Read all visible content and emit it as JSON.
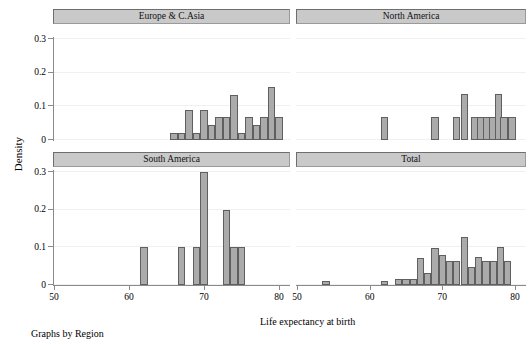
{
  "figure": {
    "ylabel": "Density",
    "xlabel": "Life expectancy at birth",
    "footnote": "Graphs by Region"
  },
  "axes": {
    "xticks": [
      "50",
      "60",
      "70",
      "80"
    ],
    "yticks": [
      "0.3",
      "0.2",
      "0.1",
      "0"
    ]
  },
  "panels": [
    {
      "title": "Europe & C.Asia"
    },
    {
      "title": "North America"
    },
    {
      "title": "South America"
    },
    {
      "title": "Total"
    }
  ],
  "chart_data": {
    "type": "bar",
    "title": "",
    "subtitle": "",
    "xlabel": "Life expectancy at birth",
    "ylabel": "Density",
    "xlim": [
      50,
      80
    ],
    "ylim": [
      0,
      0.3
    ],
    "xticks": [
      50,
      60,
      70,
      80
    ],
    "yticks": [
      0,
      0.1,
      0.2,
      0.3
    ],
    "grid": true,
    "legend": "none",
    "layout": "2x2 faceted histograms (Graphs by Region)",
    "binwidth": 1,
    "panels": [
      {
        "name": "Europe & C.Asia",
        "bins": [
          {
            "x": 66,
            "density": 0.021
          },
          {
            "x": 67,
            "density": 0.021
          },
          {
            "x": 68,
            "density": 0.089
          },
          {
            "x": 69,
            "density": 0.021
          },
          {
            "x": 70,
            "density": 0.089
          },
          {
            "x": 71,
            "density": 0.045
          },
          {
            "x": 72,
            "density": 0.067
          },
          {
            "x": 73,
            "density": 0.067
          },
          {
            "x": 74,
            "density": 0.134
          },
          {
            "x": 75,
            "density": 0.021
          },
          {
            "x": 76,
            "density": 0.067
          },
          {
            "x": 77,
            "density": 0.045
          },
          {
            "x": 78,
            "density": 0.067
          },
          {
            "x": 79,
            "density": 0.157
          },
          {
            "x": 80,
            "density": 0.067
          }
        ]
      },
      {
        "name": "North America",
        "bins": [
          {
            "x": 62,
            "density": 0.067
          },
          {
            "x": 69,
            "density": 0.067
          },
          {
            "x": 72,
            "density": 0.067
          },
          {
            "x": 73,
            "density": 0.138
          },
          {
            "x": 74.5,
            "density": 0.067
          },
          {
            "x": 75.3,
            "density": 0.067
          },
          {
            "x": 76.1,
            "density": 0.067
          },
          {
            "x": 76.9,
            "density": 0.067
          },
          {
            "x": 77.7,
            "density": 0.138
          },
          {
            "x": 78.5,
            "density": 0.067
          },
          {
            "x": 79.6,
            "density": 0.067
          }
        ]
      },
      {
        "name": "South America",
        "bins": [
          {
            "x": 62,
            "density": 0.1
          },
          {
            "x": 67,
            "density": 0.1
          },
          {
            "x": 69,
            "density": 0.1
          },
          {
            "x": 70,
            "density": 0.3
          },
          {
            "x": 73,
            "density": 0.2
          },
          {
            "x": 74,
            "density": 0.1
          },
          {
            "x": 75,
            "density": 0.1
          }
        ]
      },
      {
        "name": "Total",
        "bins": [
          {
            "x": 54,
            "density": 0.011
          },
          {
            "x": 62,
            "density": 0.011
          },
          {
            "x": 64,
            "density": 0.016
          },
          {
            "x": 65,
            "density": 0.016
          },
          {
            "x": 66,
            "density": 0.016
          },
          {
            "x": 67,
            "density": 0.072
          },
          {
            "x": 68,
            "density": 0.032
          },
          {
            "x": 69,
            "density": 0.098
          },
          {
            "x": 70,
            "density": 0.08
          },
          {
            "x": 71,
            "density": 0.064
          },
          {
            "x": 72,
            "density": 0.064
          },
          {
            "x": 73,
            "density": 0.128
          },
          {
            "x": 74,
            "density": 0.048
          },
          {
            "x": 75,
            "density": 0.074
          },
          {
            "x": 76,
            "density": 0.064
          },
          {
            "x": 77,
            "density": 0.064
          },
          {
            "x": 78,
            "density": 0.101
          },
          {
            "x": 79,
            "density": 0.064
          }
        ]
      }
    ]
  }
}
